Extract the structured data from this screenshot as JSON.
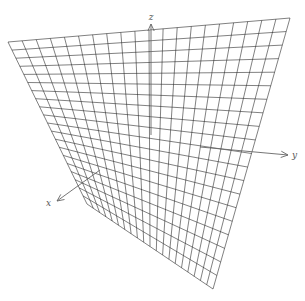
{
  "figure": {
    "background": "#ffffff",
    "line_color": "#2a2a2a",
    "axis_color": "#666666"
  },
  "surface": {
    "type": "hyperbolic-paraboloid",
    "equation": "z = x^2 - y^2",
    "grid_divisions_u": 20,
    "grid_divisions_v": 20,
    "corners": {
      "back_left": [
        8,
        42
      ],
      "back_right": [
        290,
        18
      ],
      "front_left": [
        87,
        204
      ],
      "front_right": [
        213,
        289
      ]
    }
  },
  "axes": {
    "origin": [
      151,
      135
    ],
    "z": {
      "label": "z",
      "end": [
        151,
        24
      ],
      "label_pos": [
        151,
        20
      ]
    },
    "y": {
      "label": "y",
      "end": [
        288,
        155
      ],
      "label_pos": [
        292,
        158
      ]
    },
    "x": {
      "label": "x",
      "end": [
        57,
        201
      ],
      "label_pos": [
        51,
        206
      ]
    }
  }
}
